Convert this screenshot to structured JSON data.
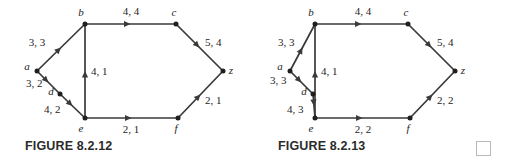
{
  "figures": [
    {
      "id": "figure-8-2-12",
      "caption": "FIGURE 8.2.12",
      "nodes": [
        {
          "name": "a",
          "label": "a",
          "x": 37,
          "y": 71,
          "label_x": 27,
          "label_y": 70
        },
        {
          "name": "b",
          "label": "b",
          "x": 85,
          "y": 24,
          "label_x": 81,
          "label_y": 16
        },
        {
          "name": "c",
          "label": "c",
          "x": 176,
          "y": 24,
          "label_x": 174,
          "label_y": 16
        },
        {
          "name": "d",
          "label": "d",
          "x": 60,
          "y": 94,
          "label_x": 51,
          "label_y": 95
        },
        {
          "name": "e",
          "label": "e",
          "x": 85,
          "y": 118,
          "label_x": 81,
          "label_y": 132
        },
        {
          "name": "f",
          "label": "f",
          "x": 178,
          "y": 118,
          "label_x": 176,
          "label_y": 132
        },
        {
          "name": "z",
          "label": "z",
          "x": 223,
          "y": 71,
          "label_x": 231,
          "label_y": 74
        }
      ],
      "edges": [
        {
          "name": "edge-a-b",
          "from": "a",
          "to": "b",
          "label": "3, 3",
          "label_x": 37,
          "label_y": 46,
          "anchor": "middle"
        },
        {
          "name": "edge-a-d",
          "from": "a",
          "to": "d",
          "label": "3, 2",
          "label_x": 26,
          "label_y": 87,
          "anchor": "start"
        },
        {
          "name": "edge-d-e",
          "from": "d",
          "to": "e",
          "label": "4, 2",
          "label_x": 44,
          "label_y": 113,
          "anchor": "start"
        },
        {
          "name": "edge-e-b",
          "from": "e",
          "to": "b",
          "label": "4, 1",
          "label_x": 91,
          "label_y": 75,
          "anchor": "start"
        },
        {
          "name": "edge-b-c",
          "from": "b",
          "to": "c",
          "label": "4, 4",
          "label_x": 131,
          "label_y": 15,
          "anchor": "middle"
        },
        {
          "name": "edge-c-z",
          "from": "c",
          "to": "z",
          "label": "5, 4",
          "label_x": 205,
          "label_y": 46,
          "anchor": "start"
        },
        {
          "name": "edge-e-f",
          "from": "e",
          "to": "f",
          "label": "2, 1",
          "label_x": 131,
          "label_y": 133,
          "anchor": "middle"
        },
        {
          "name": "edge-f-z",
          "from": "f",
          "to": "z",
          "label": "2, 1",
          "label_x": 205,
          "label_y": 104,
          "anchor": "start"
        }
      ]
    },
    {
      "id": "figure-8-2-13",
      "caption": "FIGURE 8.2.13",
      "nodes": [
        {
          "name": "a",
          "label": "a",
          "x": 37,
          "y": 71,
          "label_x": 27,
          "label_y": 70
        },
        {
          "name": "b",
          "label": "b",
          "x": 62,
          "y": 24,
          "label_x": 58,
          "label_y": 16
        },
        {
          "name": "c",
          "label": "c",
          "x": 155,
          "y": 24,
          "label_x": 153,
          "label_y": 16
        },
        {
          "name": "d",
          "label": "d",
          "x": 60,
          "y": 94,
          "label_x": 51,
          "label_y": 95
        },
        {
          "name": "e",
          "label": "e",
          "x": 62,
          "y": 118,
          "label_x": 58,
          "label_y": 132
        },
        {
          "name": "f",
          "label": "f",
          "x": 157,
          "y": 118,
          "label_x": 155,
          "label_y": 132
        },
        {
          "name": "z",
          "label": "z",
          "x": 202,
          "y": 71,
          "label_x": 210,
          "label_y": 74
        }
      ],
      "edges": [
        {
          "name": "edge-a-b",
          "from": "a",
          "to": "b",
          "label": "3, 3",
          "label_x": 25,
          "label_y": 46,
          "anchor": "start"
        },
        {
          "name": "edge-a-d",
          "from": "a",
          "to": "d",
          "label": "3, 3",
          "label_x": 17,
          "label_y": 84,
          "anchor": "start"
        },
        {
          "name": "edge-d-e",
          "from": "d",
          "to": "e",
          "label": "4, 3",
          "label_x": 34,
          "label_y": 113,
          "anchor": "start"
        },
        {
          "name": "edge-e-b",
          "from": "e",
          "to": "b",
          "label": "4, 1",
          "label_x": 68,
          "label_y": 75,
          "anchor": "start"
        },
        {
          "name": "edge-b-c",
          "from": "b",
          "to": "c",
          "label": "4, 4",
          "label_x": 110,
          "label_y": 15,
          "anchor": "middle"
        },
        {
          "name": "edge-c-z",
          "from": "c",
          "to": "z",
          "label": "5, 4",
          "label_x": 184,
          "label_y": 46,
          "anchor": "start"
        },
        {
          "name": "edge-e-f",
          "from": "e",
          "to": "f",
          "label": "2, 2",
          "label_x": 110,
          "label_y": 133,
          "anchor": "middle"
        },
        {
          "name": "edge-f-z",
          "from": "f",
          "to": "z",
          "label": "2, 2",
          "label_x": 184,
          "label_y": 104,
          "anchor": "start"
        }
      ]
    }
  ],
  "qed": {
    "name": "qed-box",
    "present": true
  },
  "style": {
    "edge_color": "#3a3a3a",
    "node_color": "#1f1f1f",
    "caption_color": "#2b2b2b",
    "qed_border_color": "#b9b9b9"
  }
}
